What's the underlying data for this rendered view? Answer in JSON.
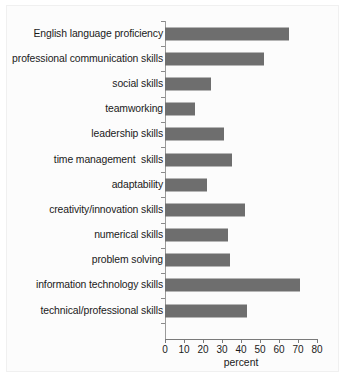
{
  "chart_data": {
    "type": "bar",
    "orientation": "horizontal",
    "title": "",
    "xlabel": "percent",
    "ylabel": "",
    "xlim": [
      0,
      80
    ],
    "xticks": [
      0,
      10,
      20,
      30,
      40,
      50,
      60,
      70,
      80
    ],
    "grid": false,
    "legend": false,
    "bar_color": "#6e6e6e",
    "categories": [
      "English language proficiency",
      "professional communication skills",
      "social skills",
      "teamworking",
      "leadership skills",
      "time management  skills",
      "adaptability",
      "creativity/innovation skills",
      "numerical skills",
      "problem solving",
      "information technology skills",
      "technical/professional skills"
    ],
    "values": [
      65,
      52,
      24,
      16,
      31,
      35,
      22,
      42,
      33,
      34,
      71,
      43
    ]
  }
}
